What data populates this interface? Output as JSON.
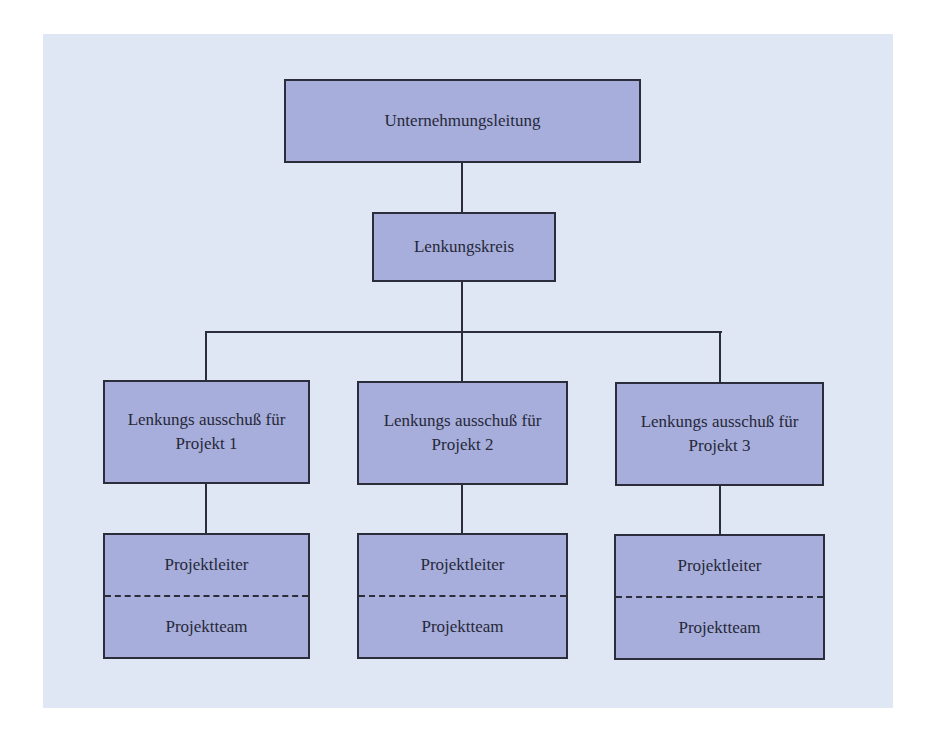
{
  "diagram": {
    "type": "org-chart",
    "colors": {
      "background_panel": "#dfe7f5",
      "node_fill": "#a7aedc",
      "node_border": "#2b2d3a",
      "connector": "#2b2d3a"
    },
    "root": {
      "label": "Unternehmungsleitung"
    },
    "steering_committee": {
      "label": "Lenkungskreis"
    },
    "project_committees": [
      {
        "line1": "Lenkungs ausschuß für",
        "line2": "Projekt 1",
        "team": {
          "leader": "Projektleiter",
          "team": "Projektteam"
        }
      },
      {
        "line1": "Lenkungs ausschuß für",
        "line2": "Projekt 2",
        "team": {
          "leader": "Projektleiter",
          "team": "Projektteam"
        }
      },
      {
        "line1": "Lenkungs ausschuß für",
        "line2": "Projekt 3",
        "team": {
          "leader": "Projektleiter",
          "team": "Projektteam"
        }
      }
    ]
  }
}
